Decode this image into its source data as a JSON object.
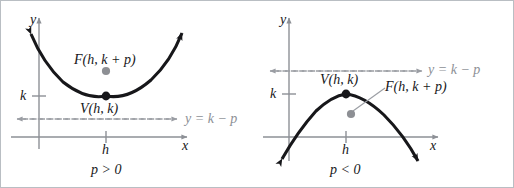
{
  "figure": {
    "colors": {
      "curve": "#17171a",
      "axis": "#8d9096",
      "directrix": "#9a9da3",
      "vertex_dot": "#17171a",
      "focus_dot": "#8d8f94",
      "frame": "#b9bec3",
      "text": "#17171a",
      "text_gray": "#8d9096"
    },
    "panels": [
      {
        "id": "panel-left",
        "name": "upward-parabola-panel",
        "axis_y_label": "y",
        "axis_x_label": "x",
        "tick_y_label": "k",
        "tick_x_label": "h",
        "vertex_label": "V(h, k)",
        "focus_label": "F(h, k + p)",
        "directrix_label": "y = k − p",
        "condition_label": "p > 0",
        "opens": "up",
        "focus_inside": true,
        "has_leader_line": false
      },
      {
        "id": "panel-right",
        "name": "downward-parabola-panel",
        "axis_y_label": "y",
        "axis_x_label": "x",
        "tick_y_label": "k",
        "tick_x_label": "h",
        "vertex_label": "V(h, k)",
        "focus_label": "F(h, k + p)",
        "directrix_label": "y = k − p",
        "condition_label": "p < 0",
        "opens": "down",
        "focus_inside": true,
        "has_leader_line": true
      }
    ]
  }
}
